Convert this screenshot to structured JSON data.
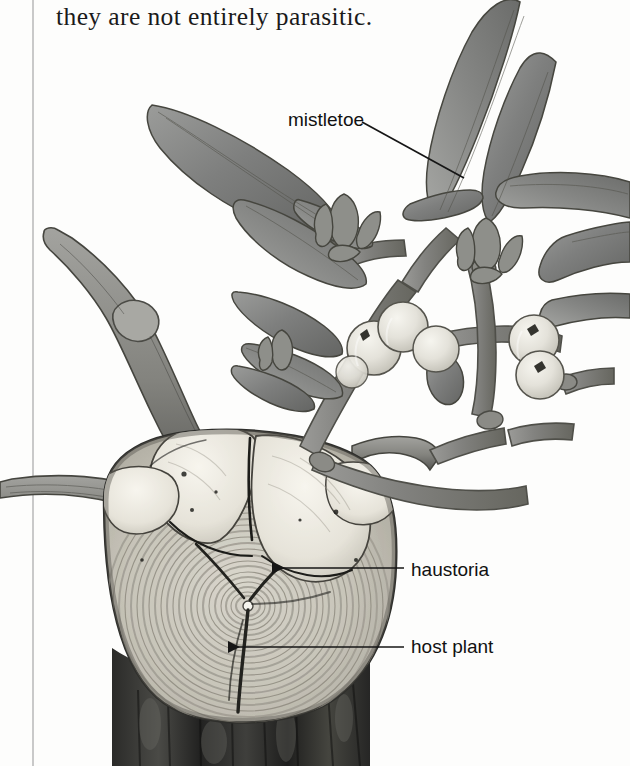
{
  "page": {
    "width": 630,
    "height": 766,
    "background_color": "#fdfdfc",
    "body_text": "they are not entirely parasitic.",
    "column_rule_color": "#c9c9c9"
  },
  "figure": {
    "medium": "grayscale halftone scan",
    "callouts": [
      {
        "id": "mistletoe",
        "label": "mistletoe",
        "text_x": 288,
        "text_y": 109,
        "leader_from_x": 362,
        "leader_from_y": 122,
        "leader_to_x": 464,
        "leader_to_y": 178,
        "leader_style": "diagonal-line",
        "arrowhead": false
      },
      {
        "id": "haustoria",
        "label": "haustoria",
        "text_x": 411,
        "text_y": 559,
        "leader_from_x": 404,
        "leader_from_y": 568,
        "leader_to_x": 272,
        "leader_to_y": 568,
        "leader_style": "horizontal-line",
        "arrowhead": true
      },
      {
        "id": "host-plant",
        "label": "host plant",
        "text_x": 411,
        "text_y": 636,
        "leader_from_x": 404,
        "leader_from_y": 647,
        "leader_to_x": 228,
        "leader_to_y": 647,
        "leader_style": "horizontal-line",
        "arrowhead": true
      }
    ],
    "palette": {
      "leaf_dark": "#6f7070",
      "leaf_mid": "#8d8e8d",
      "leaf_light": "#a9aaa8",
      "stem_dark": "#6a6a68",
      "stem_mid": "#8a8a87",
      "berry_light": "#e6e5df",
      "berry_shade": "#cfcec6",
      "berry_mark": "#3d3d3b",
      "host_branch": "#8f8f8c",
      "host_branch_dark": "#5e5e5c",
      "cut_wood_pale": "#e9e7df",
      "cut_wood_ring": "#b9b6ad",
      "cut_wood_ring_dark": "#9a968c",
      "haustoria_pale": "#f2f0e9",
      "bark_dark": "#3a3a38",
      "bark_darker": "#242423",
      "outline": "#2c2c2b",
      "leader_line": "#161616",
      "label_text": "#111111"
    }
  }
}
